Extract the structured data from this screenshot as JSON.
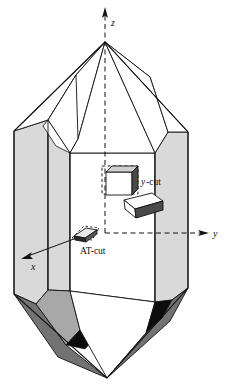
{
  "figure": {
    "background_color": "#ffffff",
    "width": 225,
    "height": 386
  },
  "axes": {
    "z": {
      "label": "z",
      "direction": "up",
      "style": "dashed-with-arrow",
      "arrow_tip": [
        105,
        8
      ],
      "label_pos": [
        111,
        26
      ]
    },
    "y": {
      "label": "y",
      "direction": "right",
      "style": "dashed-with-arrow",
      "arrow_tip": [
        209,
        233
      ],
      "label_pos": [
        214,
        237
      ]
    },
    "x": {
      "label": "x",
      "direction": "lower-left",
      "style": "solid-with-arrow",
      "arrow_tip": [
        22,
        258
      ],
      "label_pos": [
        32,
        268
      ]
    },
    "origin": [
      105,
      233
    ]
  },
  "cuts": [
    {
      "name": "y-cut",
      "label": "y-cut",
      "label_italic_prefix": "y",
      "label_rest": "-cut",
      "label_pos": [
        141,
        182
      ],
      "description": "rectangular plate aligned with dashed guide box, dark right face"
    },
    {
      "name": "unlabeled-cut",
      "label": "",
      "description": "tilted slab between y-cut and AT-cut, light top face"
    },
    {
      "name": "AT-cut",
      "label": "AT-cut",
      "label_pos": [
        87,
        251
      ],
      "description": "small inclined slab at the crystal centre, pointed to by the x axis"
    }
  ],
  "colors": {
    "outline": "#111111",
    "prism_face_light": "#d9d9d9",
    "prism_face_mid": "#c8c8c8",
    "pyramid_face_dark": "#737373",
    "pyramid_face_darker": "#5e5e5e",
    "wedge_black": "#0d0d0d",
    "cut_face_dark": "#555555",
    "cut_face_light": "#fbfbfb",
    "background": "#ffffff"
  },
  "geometry": {
    "apex": [
      105,
      42
    ],
    "bottom_tip": [
      107,
      378
    ],
    "left_edge_x": 14,
    "right_edge_x": 188
  }
}
